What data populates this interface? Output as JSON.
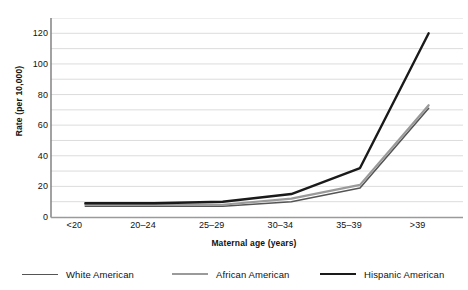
{
  "chart_data": {
    "type": "line",
    "title": "",
    "xlabel": "Maternal age (years)",
    "ylabel": "Rate (per 10,000)",
    "categories": [
      "<20",
      "20–24",
      "25–29",
      "30–34",
      "35–39",
      ">39"
    ],
    "ylim": [
      0,
      130
    ],
    "yticks": [
      0,
      20,
      40,
      60,
      80,
      100,
      120
    ],
    "ytick_labels": [
      "0",
      "20",
      "40",
      "60",
      "80",
      "100",
      "120"
    ],
    "grid": "horizontal-minor-10",
    "grid_step": 10,
    "legend_position": "bottom",
    "series": [
      {
        "name": "White American",
        "color": "#555555",
        "width": 1.6,
        "values": [
          7,
          7,
          7,
          10,
          19,
          71
        ]
      },
      {
        "name": "African American",
        "color": "#9a9a9a",
        "width": 2.2,
        "values": [
          8,
          8,
          8,
          12,
          21,
          73
        ]
      },
      {
        "name": "Hispanic American",
        "color": "#1a1a1a",
        "width": 2.4,
        "values": [
          9,
          9,
          10,
          15,
          32,
          120
        ]
      }
    ]
  },
  "legend": {
    "items": [
      {
        "label": "White American"
      },
      {
        "label": "African American"
      },
      {
        "label": "Hispanic American"
      }
    ]
  }
}
